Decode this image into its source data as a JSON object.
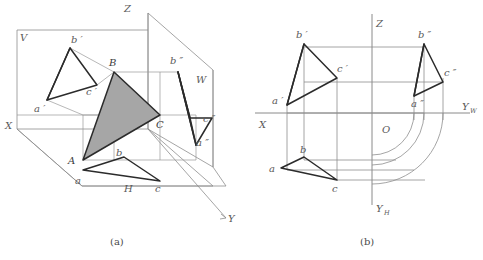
{
  "figure": {
    "captions": {
      "left": "(a)",
      "right": "(b)"
    },
    "colors": {
      "shaded_triangle_fill": "#a6a6a6",
      "bold_stroke": "#2b2b2b",
      "thin_stroke": "#8e8e8e",
      "label_text": "#5a5a5a",
      "background": "#ffffff"
    }
  },
  "panel_a": {
    "name": "pictorial-three-plane-view",
    "plane_labels": {
      "v": "V",
      "h": "H",
      "w": "W"
    },
    "axis_labels": {
      "x": "X",
      "y": "Y",
      "z": "Z"
    },
    "space_points": {
      "A": "A",
      "B": "B",
      "C": "C"
    },
    "frontal_projection": {
      "a": "a",
      "b": "b",
      "c": "c",
      "a_prime": "a ′",
      "b_prime": "b ′",
      "c_prime": "c ′"
    },
    "horizontal_projection": {
      "a": "a",
      "b": "b",
      "c": "c"
    },
    "profile_projection": {
      "a_double": "a ″",
      "b_double": "b ″",
      "c_double": "c ″"
    }
  },
  "panel_b": {
    "name": "orthographic-layout-view",
    "axis_labels": {
      "x": "X",
      "z": "Z",
      "yw": "Y",
      "yw_sub": "W",
      "yh": "Y",
      "yh_sub": "H",
      "origin": "O"
    },
    "frontal_projection": {
      "a_prime": "a ′",
      "b_prime": "b ′",
      "c_prime": "c ′"
    },
    "horizontal_projection": {
      "a": "a",
      "b": "b",
      "c": "c"
    },
    "profile_projection": {
      "a_double": "a ″",
      "b_double": "b ″",
      "c_double": "c ″"
    },
    "arc_count": 3
  }
}
